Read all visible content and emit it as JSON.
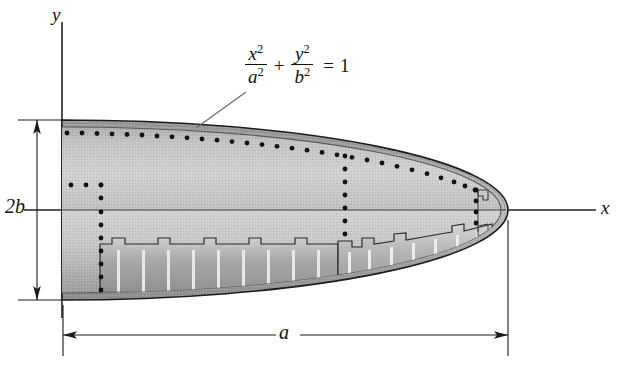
{
  "figure": {
    "background_color": "#ffffff",
    "axes": {
      "y_label": "y",
      "x_label": "x",
      "origin_px": [
        62,
        210
      ],
      "y_axis_top_px": 22,
      "x_axis_right_px": 596,
      "axis_color": "#222222"
    },
    "equation": {
      "lhs_term1_numerator": "x",
      "lhs_term1_numerator_exp": "2",
      "lhs_term1_denominator": "a",
      "lhs_term1_denominator_exp": "2",
      "operator": "+",
      "lhs_term2_numerator": "y",
      "lhs_term2_numerator_exp": "2",
      "lhs_term2_denominator": "b",
      "lhs_term2_denominator_exp": "2",
      "equals": "=",
      "rhs": "1",
      "plain_text": "x^2/a^2 + y^2/b^2 = 1",
      "leader_from_px": [
        196,
        128
      ],
      "leader_to_px": [
        246,
        92
      ]
    },
    "dimensions": [
      {
        "name": "semi-minor-total",
        "label": "2b",
        "orientation": "vertical",
        "from_px": [
          37,
          120
        ],
        "to_px": [
          37,
          300
        ],
        "extension_top_y": 120,
        "extension_bottom_y": 300
      },
      {
        "name": "semi-major",
        "label": "a",
        "orientation": "horizontal",
        "from_px": [
          63,
          335
        ],
        "to_px": [
          508,
          335
        ],
        "extension_left_x": 63,
        "extension_right_x": 508
      }
    ],
    "ellipse": {
      "center_px": [
        62,
        210
      ],
      "semi_major_a_px": 446,
      "semi_minor_b_px": 90,
      "outline_color": "#1a1a1a",
      "skin_fill": "#b9b9b9",
      "body_fill_light": "#cccccc",
      "body_fill_mid": "#a8a8a8",
      "body_fill_dark": "#8e8e8e"
    },
    "structure": {
      "lower_bulkhead_fill": "#9a9a9a",
      "rib_stripe_color": "#e2e2e2",
      "rivet_color": "#111111",
      "rivet_rows": [
        {
          "name": "upper-skin-rivet-row",
          "count": 30
        },
        {
          "name": "mid-horizontal-rivet-row",
          "count": 3
        },
        {
          "name": "left-vertical-rivet-column",
          "count": 11
        },
        {
          "name": "mid-vertical-rivet-column",
          "count": 9
        },
        {
          "name": "right-vertical-rivet-column",
          "count": 7
        }
      ]
    },
    "colors": {
      "ink": "#111111",
      "axis": "#222222",
      "paper": "#ffffff",
      "outline": "#1a1a1a"
    }
  }
}
